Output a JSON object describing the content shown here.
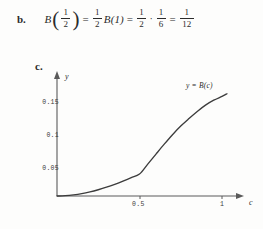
{
  "part_b": {
    "label": "b.",
    "equation": {
      "plain": "B(1/2) = (1/2)B(1) = (1/2)·(1/6) = 1/12",
      "func_name": "B",
      "arg_num": "1",
      "arg_den": "2",
      "eq1": "=",
      "coef_num": "1",
      "coef_den": "2",
      "term2": "B(1)",
      "eq2": "=",
      "f1_num": "1",
      "f1_den": "2",
      "dot": "·",
      "f2_num": "1",
      "f2_den": "6",
      "eq3": "=",
      "result_num": "1",
      "result_den": "12",
      "open_paren": "(",
      "close_paren": ")"
    }
  },
  "part_c": {
    "label": "c.",
    "curve_label": "y = B(c)"
  },
  "chart_data": {
    "type": "line",
    "title": "",
    "xlabel": "c",
    "ylabel": "y",
    "xlim": [
      0,
      1.13
    ],
    "ylim": [
      0,
      0.178
    ],
    "grid": false,
    "legend": "none",
    "xticks": [
      0.5,
      1
    ],
    "xtick_labels": [
      "0.5",
      "1"
    ],
    "yticks": [
      0.05,
      0.1,
      0.15
    ],
    "ytick_labels": [
      "0.05",
      "0.1",
      "0.15"
    ],
    "annotations": [
      "y = B(c)"
    ],
    "series": [
      {
        "name": "y = B(c)",
        "color": "#3c3c3c",
        "x": [
          0,
          0.05,
          0.1,
          0.15,
          0.2,
          0.25,
          0.3,
          0.35,
          0.4,
          0.45,
          0.5,
          0.55,
          0.6,
          0.65,
          0.7,
          0.75,
          0.8,
          0.85,
          0.9,
          0.95,
          1.0,
          1.03
        ],
        "y": [
          0,
          0.0005,
          0.0018,
          0.0038,
          0.0066,
          0.0101,
          0.0142,
          0.0189,
          0.0241,
          0.0296,
          0.0354,
          0.0514,
          0.0676,
          0.0836,
          0.0989,
          0.1128,
          0.1249,
          0.1363,
          0.1465,
          0.1545,
          0.1606,
          0.1649
        ]
      }
    ]
  },
  "colors": {
    "curve": "#3c3c3c",
    "axis": "#5a5a5a",
    "text": "#2b2b2b",
    "background": "#fdfdfc"
  }
}
